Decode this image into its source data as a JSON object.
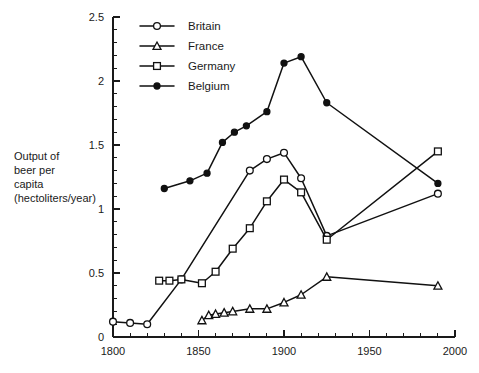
{
  "chart_data": {
    "type": "line",
    "title": "",
    "subtitle": "",
    "xlabel": "",
    "ylabel": "Output of beer per capita (hectoliters/year)",
    "ylabel_lines": [
      "Output of",
      "beer per",
      "capita",
      "(hectoliters/year)"
    ],
    "xlim": [
      1800,
      2000
    ],
    "ylim": [
      0,
      2.5
    ],
    "x_ticks": [
      1800,
      1850,
      1900,
      1950,
      2000
    ],
    "x_tick_labels": [
      "1800",
      "1850",
      "1900",
      "1950",
      "2000"
    ],
    "x_minor_step": 10,
    "y_ticks": [
      0,
      0.5,
      1,
      1.5,
      2,
      2.5
    ],
    "y_tick_labels": [
      "0",
      "0.5",
      "1",
      "1.5",
      "2",
      "2.5"
    ],
    "y_minor_step": 0.1,
    "grid": false,
    "legend_position": "top-left-inside",
    "series": [
      {
        "name": "Britain",
        "marker": "circle-open",
        "points": [
          {
            "x": 1800,
            "y": 0.12
          },
          {
            "x": 1810,
            "y": 0.11
          },
          {
            "x": 1820,
            "y": 0.1
          },
          {
            "x": 1840,
            "y": 0.45
          },
          {
            "x": 1880,
            "y": 1.3
          },
          {
            "x": 1890,
            "y": 1.39
          },
          {
            "x": 1900,
            "y": 1.44
          },
          {
            "x": 1910,
            "y": 1.24
          },
          {
            "x": 1925,
            "y": 0.79
          },
          {
            "x": 1990,
            "y": 1.12
          }
        ]
      },
      {
        "name": "France",
        "marker": "triangle-open",
        "points": [
          {
            "x": 1852,
            "y": 0.13
          },
          {
            "x": 1856,
            "y": 0.17
          },
          {
            "x": 1860,
            "y": 0.18
          },
          {
            "x": 1865,
            "y": 0.19
          },
          {
            "x": 1870,
            "y": 0.2
          },
          {
            "x": 1880,
            "y": 0.22
          },
          {
            "x": 1890,
            "y": 0.22
          },
          {
            "x": 1900,
            "y": 0.27
          },
          {
            "x": 1910,
            "y": 0.33
          },
          {
            "x": 1925,
            "y": 0.47
          },
          {
            "x": 1990,
            "y": 0.4
          }
        ]
      },
      {
        "name": "Germany",
        "marker": "square-open",
        "points": [
          {
            "x": 1827,
            "y": 0.44
          },
          {
            "x": 1833,
            "y": 0.44
          },
          {
            "x": 1840,
            "y": 0.45
          },
          {
            "x": 1852,
            "y": 0.42
          },
          {
            "x": 1860,
            "y": 0.51
          },
          {
            "x": 1870,
            "y": 0.69
          },
          {
            "x": 1880,
            "y": 0.85
          },
          {
            "x": 1890,
            "y": 1.06
          },
          {
            "x": 1900,
            "y": 1.23
          },
          {
            "x": 1910,
            "y": 1.13
          },
          {
            "x": 1925,
            "y": 0.76
          },
          {
            "x": 1990,
            "y": 1.45
          }
        ]
      },
      {
        "name": "Belgium",
        "marker": "circle-filled",
        "points": [
          {
            "x": 1830,
            "y": 1.16
          },
          {
            "x": 1845,
            "y": 1.22
          },
          {
            "x": 1855,
            "y": 1.28
          },
          {
            "x": 1864,
            "y": 1.52
          },
          {
            "x": 1871,
            "y": 1.6
          },
          {
            "x": 1878,
            "y": 1.65
          },
          {
            "x": 1890,
            "y": 1.76
          },
          {
            "x": 1900,
            "y": 2.14
          },
          {
            "x": 1910,
            "y": 2.19
          },
          {
            "x": 1925,
            "y": 1.83
          },
          {
            "x": 1990,
            "y": 1.2
          }
        ]
      }
    ],
    "legend": [
      {
        "label": "Britain",
        "marker": "circle-open"
      },
      {
        "label": "France",
        "marker": "triangle-open"
      },
      {
        "label": "Germany",
        "marker": "square-open"
      },
      {
        "label": "Belgium",
        "marker": "circle-filled"
      }
    ],
    "colors": {
      "ink": "#111111",
      "background": "#ffffff",
      "marker_fill_open": "#ffffff"
    }
  }
}
